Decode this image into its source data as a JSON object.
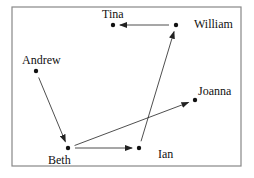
{
  "diagram": {
    "type": "directed-graph",
    "frame": {
      "x": 12,
      "y": 7,
      "width": 229,
      "height": 159
    },
    "nodes": [
      {
        "id": "tina",
        "label": "Tina",
        "x": 113,
        "y": 25,
        "label_x": 102,
        "label_y": 18
      },
      {
        "id": "william",
        "label": "William",
        "x": 176,
        "y": 25,
        "label_x": 194,
        "label_y": 28
      },
      {
        "id": "andrew",
        "label": "Andrew",
        "x": 36,
        "y": 71,
        "label_x": 22,
        "label_y": 64
      },
      {
        "id": "joanna",
        "label": "Joanna",
        "x": 195,
        "y": 100,
        "label_x": 198,
        "label_y": 95
      },
      {
        "id": "beth",
        "label": "Beth",
        "x": 68,
        "y": 148,
        "label_x": 48,
        "label_y": 164
      },
      {
        "id": "ian",
        "label": "Ian",
        "x": 139,
        "y": 148,
        "label_x": 158,
        "label_y": 158
      }
    ],
    "edges": [
      {
        "from": "william",
        "to": "tina"
      },
      {
        "from": "andrew",
        "to": "beth"
      },
      {
        "from": "beth",
        "to": "joanna"
      },
      {
        "from": "beth",
        "to": "ian"
      },
      {
        "from": "ian",
        "to": "william"
      }
    ]
  }
}
